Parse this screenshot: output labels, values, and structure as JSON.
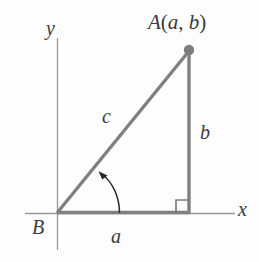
{
  "figure": {
    "background_color": "#fdfdfd",
    "axis_color": "#9a9a9a",
    "triangle_color": "#808080",
    "label_color": "#3a3a3a",
    "arc_color": "#2b2b2b"
  },
  "axes": {
    "x_label": "x",
    "y_label": "y",
    "origin_label": "B"
  },
  "vertices": {
    "A": {
      "label": "A",
      "open_paren": "(",
      "coord_x": "a",
      "comma": ", ",
      "coord_y": "b",
      "close_paren": ")",
      "full_label": "A(a, b)"
    },
    "B": {
      "label": "B"
    }
  },
  "sides": {
    "base": "a",
    "vertical": "b",
    "hypotenuse": "c"
  },
  "markers": {
    "right_angle": "right-angle-square",
    "angle_arc": "angle-arc-arrow"
  },
  "geometry": {
    "origin": [
      57,
      213
    ],
    "apex": [
      189,
      50
    ],
    "right_angle_corner": [
      189,
      213
    ],
    "x_axis": [
      25,
      213,
      235,
      213
    ],
    "y_axis": [
      57,
      38,
      57,
      250
    ]
  }
}
